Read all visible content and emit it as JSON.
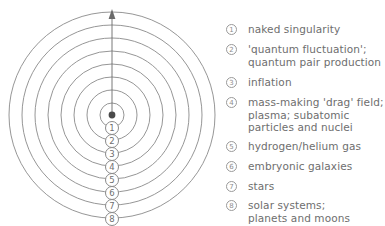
{
  "diagram": {
    "center_dot_color": "#4a4a4a",
    "ring_color": "#8a8a8a",
    "arrow_color": "#6a6a6a",
    "arrow_direction": "up",
    "ring_count": 8,
    "ring_labels": [
      "1",
      "2",
      "3",
      "4",
      "5",
      "6",
      "7",
      "8"
    ],
    "ring_label_glyphs": [
      "①",
      "②",
      "③",
      "④",
      "⑤",
      "⑥",
      "⑦",
      "⑧"
    ]
  },
  "legend": {
    "text_color": "#6e6e6e",
    "items": [
      {
        "marker": "①",
        "number": "1",
        "label": "naked singularity"
      },
      {
        "marker": "②",
        "number": "2",
        "label": "'quantum fluctuation';\nquantum pair production"
      },
      {
        "marker": "③",
        "number": "3",
        "label": "inflation"
      },
      {
        "marker": "④",
        "number": "4",
        "label": "mass-making 'drag' field;\nplasma; subatomic\nparticles and nuclei"
      },
      {
        "marker": "⑤",
        "number": "5",
        "label": "hydrogen/helium gas"
      },
      {
        "marker": "⑥",
        "number": "6",
        "label": "embryonic galaxies"
      },
      {
        "marker": "⑦",
        "number": "7",
        "label": "stars"
      },
      {
        "marker": "⑧",
        "number": "8",
        "label": "solar systems;\nplanets and moons"
      }
    ]
  }
}
